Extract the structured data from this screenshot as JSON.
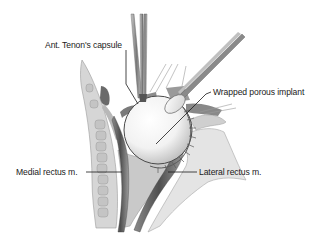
{
  "figure": {
    "labels": {
      "tenon": "Ant. Tenon's capsule",
      "implant": "Wrapped porous implant",
      "medial": "Medial rectus m.",
      "lateral": "Lateral rectus m."
    },
    "colors": {
      "background": "#ffffff",
      "leader_line": "#1a1a1a",
      "bone_light": "#d9d9d9",
      "tissue_mid": "#9a9a9a",
      "muscle_dark": "#5e5e5e",
      "implant": "#f6f6f6"
    }
  }
}
